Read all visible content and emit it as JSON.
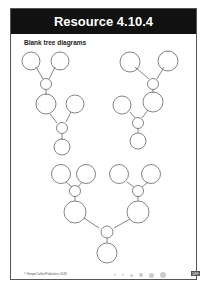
{
  "header": {
    "title": "Resource 4.10.4"
  },
  "content": {
    "subtitle": "Blank tree diagrams"
  },
  "footer": {
    "copyright": "© HarperCollinsPublishers 2018",
    "page_number": "189"
  },
  "colors": {
    "header_bg": "#111111",
    "circle_stroke": "#666666"
  }
}
